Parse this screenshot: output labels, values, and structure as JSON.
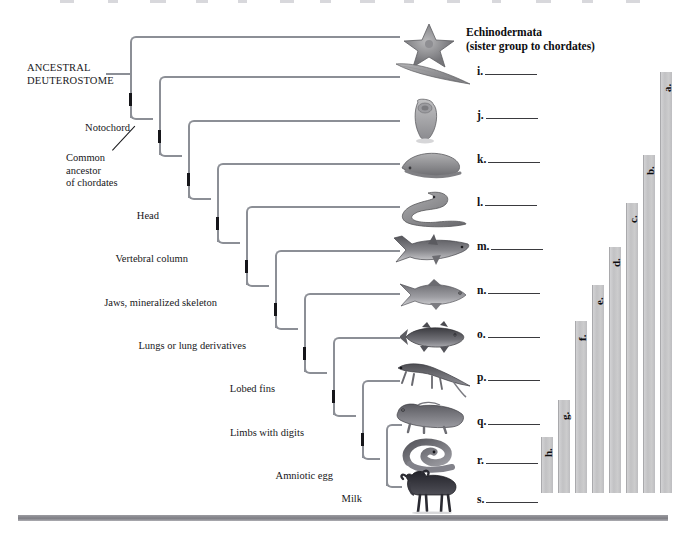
{
  "figure": {
    "root_label_line1": "ANCESTRAL",
    "root_label_line2": "DEUTEROSTOME",
    "common_ancestor_label_line1": "Common",
    "common_ancestor_label_line2": "ancestor",
    "common_ancestor_label_line3": "of chordates",
    "echinoderm_caption_line1": "Echinodermata",
    "echinoderm_caption_line2": "(sister group to chordates)"
  },
  "traits": [
    {
      "id": "notochord",
      "label": "Notochord"
    },
    {
      "id": "head",
      "label": "Head"
    },
    {
      "id": "vertebral-column",
      "label": "Vertebral column"
    },
    {
      "id": "jaws",
      "label": "Jaws, mineralized skeleton"
    },
    {
      "id": "lungs",
      "label": "Lungs or lung derivatives"
    },
    {
      "id": "lobed-fins",
      "label": "Lobed fins"
    },
    {
      "id": "limbs",
      "label": "Limbs with digits"
    },
    {
      "id": "amniotic-egg",
      "label": "Amniotic egg"
    },
    {
      "id": "milk",
      "label": "Milk"
    }
  ],
  "taxa_blanks": [
    {
      "letter": "i.",
      "organism": "lancelet-icon"
    },
    {
      "letter": "j.",
      "organism": "tunicate-icon"
    },
    {
      "letter": "k.",
      "organism": "hagfish-icon"
    },
    {
      "letter": "l.",
      "organism": "lamprey-icon"
    },
    {
      "letter": "m.",
      "organism": "shark-icon"
    },
    {
      "letter": "n.",
      "organism": "ray-finned-fish-icon"
    },
    {
      "letter": "o.",
      "organism": "coelacanth-icon"
    },
    {
      "letter": "p.",
      "organism": "salamander-icon"
    },
    {
      "letter": "q.",
      "organism": "lizard-icon"
    },
    {
      "letter": "r.",
      "organism": "snake-icon"
    },
    {
      "letter": "s.",
      "organism": "wildebeest-icon"
    }
  ],
  "chart_data": {
    "type": "bar",
    "title": "",
    "xlabel": "",
    "ylabel": "",
    "orientation": "vertical",
    "grid": false,
    "legend": false,
    "categories": [
      "h.",
      "g.",
      "f.",
      "e.",
      "d.",
      "c.",
      "b.",
      "a."
    ],
    "values": [
      13,
      22,
      41,
      50,
      59,
      69,
      81,
      100
    ],
    "ylim": [
      0,
      100
    ],
    "bars": [
      {
        "letter": "h.",
        "value": 13,
        "x": 541,
        "top": 437,
        "bottom": 493,
        "width": 12
      },
      {
        "letter": "g.",
        "value": 22,
        "x": 558,
        "top": 400,
        "bottom": 493,
        "width": 12
      },
      {
        "letter": "f.",
        "value": 41,
        "x": 575,
        "top": 321,
        "bottom": 493,
        "width": 12
      },
      {
        "letter": "e.",
        "value": 50,
        "x": 592,
        "top": 285,
        "bottom": 493,
        "width": 12
      },
      {
        "letter": "d.",
        "value": 59,
        "x": 609,
        "top": 247,
        "bottom": 493,
        "width": 12
      },
      {
        "letter": "c.",
        "value": 69,
        "x": 626,
        "top": 203,
        "bottom": 493,
        "width": 12
      },
      {
        "letter": "b.",
        "value": 81,
        "x": 643,
        "top": 155,
        "bottom": 493,
        "width": 12
      },
      {
        "letter": "a.",
        "value": 100,
        "x": 660,
        "top": 72,
        "bottom": 493,
        "width": 12
      }
    ]
  },
  "colors": {
    "branch": "#8c8f96",
    "hashmark": "#16161a",
    "bar_fill": "#c8c8cb",
    "bar_edge": "#a9a9ac",
    "text": "#17171a",
    "rule": "#7e7e84",
    "background": "#ffffff"
  }
}
